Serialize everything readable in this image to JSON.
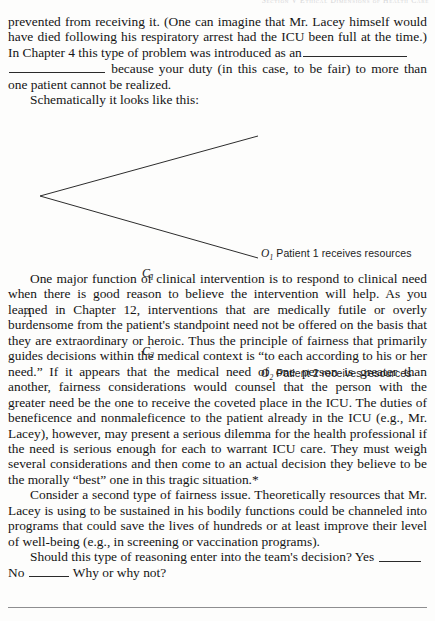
{
  "page": {
    "running_head": "Section V  Ethical Dimensions of Health Care",
    "footnote_rule": true
  },
  "text_blocks": {
    "paragraph_1_part_1": "prevented from receiving it. (One can imagine that Mr. Lacey himself would have died following his respiratory arrest had the ICU been full at the time.) In Chapter 4 this type of problem was introduced as an",
    "paragraph_1_part_2": "because your duty (in this case, to be fair) to more than one patient cannot be realized.",
    "paragraph_2": "Schematically it looks like this:",
    "paragraph_3": "One major function of clinical intervention is to respond to clinical need when there is good reason to believe the intervention will help. As you learned in Chapter 12, interventions that are medically futile or overly burdensome from the patient's standpoint need not be offered on the basis that they are extraordinary or heroic. Thus the principle of fairness that primarily guides decisions within the medical context is “to each according to his or her need.” If it appears that the medical need of one person is greater than another, fairness considerations would counsel that the person with the greater need be the one to receive the coveted place in the ICU. The duties of beneficence and nonmaleficence to the patient already in the ICU (e.g., Mr. Lacey), however, may present a serious dilemma for the health professional if the need is serious enough for each to warrant ICU care. They must weigh several considerations and then come to an actual decision they believe to be the morally “best” one in this tragic situation.*",
    "paragraph_4": "Consider a second type of fairness issue. Theoretically resources that Mr. Lacey is using to be sustained in his bodily functions could be channeled into programs that could save the lives of hundreds or at least improve their level of well-being (e.g., in screening or vaccination programs).",
    "paragraph_5_part_1": "Should this type of reasoning enter into the team's decision? Yes",
    "paragraph_5_part_2": "No",
    "paragraph_5_part_3": "Why or why not?"
  },
  "diagram": {
    "type": "decision-tree",
    "root_label": "A",
    "branches": [
      {
        "label": "C",
        "subscript": "1",
        "outcome_id": "O",
        "outcome_subscript": "1",
        "outcome_text": "Patient 1 receives resources"
      },
      {
        "label": "C",
        "subscript": "2",
        "outcome_id": "O",
        "outcome_subscript": "2",
        "outcome_text": "Patient 2 receives resources"
      }
    ]
  },
  "colors": {
    "page_background": "#fdfdfc",
    "text": "#141414",
    "rule": "#8e8e90",
    "diagram_line": "#2c2c2c",
    "running_head": "#c9c9cc"
  }
}
